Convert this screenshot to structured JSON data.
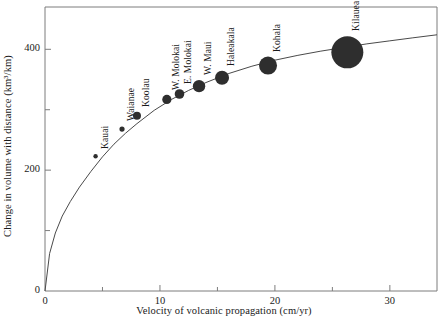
{
  "chart_data": {
    "type": "scatter",
    "title": "",
    "xlabel": "Velocity of volcanic propagation  (cm/yr)",
    "ylabel": "Change in volume with distance  (km3/km)",
    "ylabel_display": "Change in volume with distance  (km³/km)",
    "xlim": [
      0,
      34.1
    ],
    "ylim": [
      0,
      470
    ],
    "grid": false,
    "legend": "none",
    "marker_color": "#2e2e2e",
    "curve_color": "#4a4a4a",
    "axis_color": "#7d7d7d",
    "x_major_ticks": [
      0,
      10,
      20,
      30
    ],
    "x_major_tick_labels": [
      "0",
      "10",
      "20",
      "30"
    ],
    "x_minor_ticks": [
      5,
      15,
      25
    ],
    "y_major_ticks": [
      0,
      200,
      400
    ],
    "y_major_tick_labels": [
      "0",
      "200",
      "400"
    ],
    "y_minor_ticks": [
      100,
      300
    ],
    "series": [
      {
        "name": "Hawaiian volcanoes",
        "points": [
          {
            "label": "Kauai",
            "x": 4.4,
            "y": 223,
            "marker_radius": 2.2
          },
          {
            "label": "Waianae",
            "x": 6.7,
            "y": 268,
            "marker_radius": 2.6
          },
          {
            "label": "Koolau",
            "x": 8.0,
            "y": 290,
            "marker_radius": 4.0
          },
          {
            "label": "W. Molokai",
            "x": 10.6,
            "y": 317,
            "marker_radius": 4.6
          },
          {
            "label": "E. Molokai",
            "x": 11.7,
            "y": 326,
            "marker_radius": 4.8
          },
          {
            "label": "W. Maui",
            "x": 13.4,
            "y": 339,
            "marker_radius": 6.2
          },
          {
            "label": "Haleakala",
            "x": 15.4,
            "y": 353,
            "marker_radius": 7.0
          },
          {
            "label": "Kohala",
            "x": 19.4,
            "y": 373,
            "marker_radius": 9.0
          },
          {
            "label": "Kilauea",
            "x": 26.3,
            "y": 395,
            "marker_radius": 16.0
          }
        ]
      }
    ],
    "fit_curve": {
      "description": "monotonic rising power-law trend through the data, from origin",
      "x": [
        0,
        0.4,
        0.9,
        1.5,
        2.2,
        3.0,
        4.0,
        5.0,
        6.0,
        7.0,
        8.0,
        9.5,
        11.0,
        12.5,
        14.0,
        16.0,
        18.0,
        20.0,
        22.0,
        24.0,
        26.0,
        28.0,
        30.0,
        32.0,
        34.1
      ],
      "y": [
        0,
        62,
        96,
        124,
        148,
        172,
        198,
        222,
        243,
        261,
        277,
        299,
        317,
        332,
        345,
        360,
        372,
        382,
        390,
        397,
        403,
        409,
        414,
        419,
        424
      ]
    }
  },
  "geometry": {
    "plot_left": 45,
    "plot_right": 437,
    "plot_top": 7,
    "plot_bottom": 291
  }
}
